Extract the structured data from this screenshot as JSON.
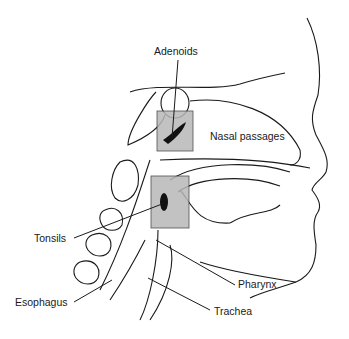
{
  "figure": {
    "labels": {
      "adenoids": "Adenoids",
      "nasal_passages": "Nasal passages",
      "tonsils": "Tonsils",
      "pharynx": "Pharynx",
      "esophagus": "Esophagus",
      "trachea": "Trachea"
    },
    "colors": {
      "line": "#1a1a1a",
      "highlight_box": "#b8b8b8",
      "tissue": "#111111"
    }
  }
}
